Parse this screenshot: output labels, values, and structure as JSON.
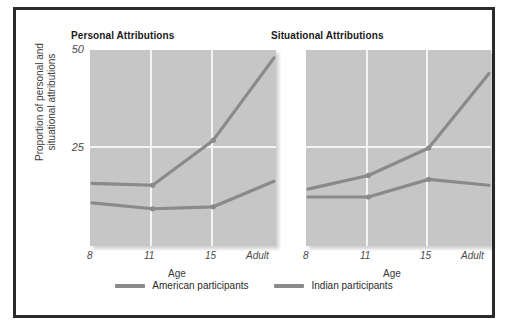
{
  "figure": {
    "legend": [
      {
        "label": "American participants",
        "color": "#8a8a8a",
        "swatch": "line-swatch"
      },
      {
        "label": "Indian participants",
        "color": "#8a8a8a",
        "swatch": "line-swatch"
      }
    ],
    "frame_color": "#2b2b2b",
    "plot_background": "#c6c6c6",
    "gridline_color": "#f4f4f4"
  },
  "panels": {
    "left": {
      "title": "Personal Attributions",
      "xlabel": "Age",
      "ylabel_line1": "Proportion of personal and",
      "ylabel_line2": "situational attributions",
      "yticks": [
        "50",
        "25"
      ],
      "xticks": [
        "8",
        "11",
        "15",
        "Adult"
      ]
    },
    "right": {
      "title": "Situational Attributions",
      "xlabel": "Age",
      "yticks": [],
      "xticks": [
        "8",
        "11",
        "15",
        "Adult"
      ]
    }
  },
  "chart_data": [
    {
      "type": "line",
      "title": "Personal Attributions",
      "xlabel": "Age",
      "ylabel": "Proportion of personal and situational attributions",
      "categories": [
        "8",
        "11",
        "15",
        "Adult"
      ],
      "ylim": [
        0,
        50
      ],
      "yticks": [
        25,
        50
      ],
      "grid": true,
      "legend_position": "bottom",
      "series": [
        {
          "name": "American participants",
          "values": [
            16,
            15.5,
            27,
            48
          ]
        },
        {
          "name": "Indian participants",
          "values": [
            11,
            9.5,
            10,
            16.5
          ]
        }
      ]
    },
    {
      "type": "line",
      "title": "Situational Attributions",
      "xlabel": "Age",
      "ylabel": "Proportion of personal and situational attributions",
      "categories": [
        "8",
        "11",
        "15",
        "Adult"
      ],
      "ylim": [
        0,
        50
      ],
      "yticks": [
        25,
        50
      ],
      "grid": true,
      "legend_position": "bottom",
      "series": [
        {
          "name": "American participants",
          "values": [
            14.5,
            18,
            25,
            44
          ]
        },
        {
          "name": "Indian participants",
          "values": [
            12.5,
            12.5,
            17,
            15.5
          ]
        }
      ]
    }
  ]
}
